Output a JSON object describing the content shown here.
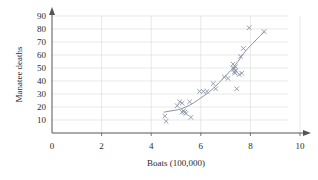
{
  "chart_data": {
    "type": "scatter",
    "title": "",
    "xlabel": "Boats (100,000)",
    "ylabel": "Manatee deaths",
    "xlim": [
      0,
      10
    ],
    "ylim": [
      0,
      90
    ],
    "xticks": [
      0,
      2,
      4,
      6,
      8,
      10
    ],
    "yticks": [
      10,
      20,
      30,
      40,
      50,
      60,
      70,
      80,
      90
    ],
    "xtick_labels": [
      "0",
      "2",
      "4",
      "6",
      "8",
      "10"
    ],
    "ytick_labels": [
      "10",
      "20",
      "30",
      "40",
      "50",
      "60",
      "70",
      "80",
      "90"
    ],
    "grid": true,
    "legend": "none",
    "marker": "x",
    "marker_color": "#8a94a6",
    "curve_color": "#8a94a6",
    "axis_color": "#555555",
    "grid_color": "#d9d9d9",
    "series": [
      {
        "name": "Manatee deaths vs boats",
        "points": [
          [
            4.55,
            13
          ],
          [
            4.6,
            9
          ],
          [
            5.05,
            21
          ],
          [
            5.15,
            24
          ],
          [
            5.25,
            23
          ],
          [
            5.25,
            16
          ],
          [
            5.3,
            17
          ],
          [
            5.35,
            16
          ],
          [
            5.4,
            15
          ],
          [
            5.55,
            24
          ],
          [
            5.6,
            12
          ],
          [
            5.95,
            32
          ],
          [
            6.1,
            32
          ],
          [
            6.25,
            32
          ],
          [
            6.5,
            38
          ],
          [
            6.6,
            34
          ],
          [
            6.95,
            43
          ],
          [
            7.1,
            42
          ],
          [
            7.3,
            53
          ],
          [
            7.32,
            50
          ],
          [
            7.33,
            49
          ],
          [
            7.35,
            47
          ],
          [
            7.38,
            46
          ],
          [
            7.4,
            51
          ],
          [
            7.42,
            48
          ],
          [
            7.45,
            34
          ],
          [
            7.55,
            45
          ],
          [
            7.6,
            59
          ],
          [
            7.65,
            46
          ],
          [
            7.72,
            65
          ],
          [
            7.95,
            81
          ],
          [
            8.55,
            78
          ]
        ],
        "fit_curve": [
          [
            4.5,
            16
          ],
          [
            4.8,
            17
          ],
          [
            5.1,
            18
          ],
          [
            5.4,
            20
          ],
          [
            5.7,
            23
          ],
          [
            6.0,
            27
          ],
          [
            6.3,
            31
          ],
          [
            6.6,
            36
          ],
          [
            6.9,
            42
          ],
          [
            7.2,
            48
          ],
          [
            7.5,
            55
          ],
          [
            7.8,
            63
          ],
          [
            8.1,
            69
          ],
          [
            8.35,
            74
          ],
          [
            8.58,
            78
          ]
        ]
      }
    ]
  }
}
